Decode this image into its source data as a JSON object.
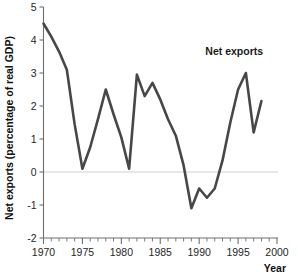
{
  "chart_data": {
    "type": "line",
    "title": "",
    "xlabel": "Year",
    "ylabel": "Net exports (percentage of real GDP)",
    "xlim": [
      1970,
      2000
    ],
    "ylim": [
      -2,
      5
    ],
    "grid": false,
    "zero_line": true,
    "legend_position": "inline-annotation",
    "annotations": [
      {
        "text": "Net exports",
        "x": 1994.5,
        "y": 3.55
      }
    ],
    "xticks": [
      1970,
      1975,
      1980,
      1985,
      1990,
      1995,
      2000
    ],
    "xtick_labels": [
      "1970",
      "1975",
      "1980",
      "1985",
      "1990",
      "1995",
      "2000"
    ],
    "xminor_tick_step": 1,
    "yticks": [
      -2,
      -1,
      0,
      1,
      2,
      3,
      4,
      5
    ],
    "ytick_labels": [
      "-2",
      "-1",
      "0",
      "1",
      "2",
      "3",
      "4",
      "5"
    ],
    "series": [
      {
        "name": "Net exports",
        "color": "#474747",
        "x": [
          1970,
          1971,
          1972,
          1973,
          1974,
          1975,
          1976,
          1977,
          1978,
          1979,
          1980,
          1981,
          1982,
          1983,
          1984,
          1985,
          1986,
          1987,
          1988,
          1989,
          1990,
          1991,
          1992,
          1993,
          1994,
          1995,
          1996,
          1997,
          1998
        ],
        "values": [
          4.5,
          4.1,
          3.65,
          3.1,
          1.45,
          0.1,
          0.75,
          1.6,
          2.5,
          1.75,
          1.05,
          0.1,
          2.95,
          2.3,
          2.7,
          2.2,
          1.6,
          1.1,
          0.2,
          -1.1,
          -0.5,
          -0.78,
          -0.5,
          0.35,
          1.5,
          2.5,
          3.0,
          1.2,
          2.15
        ]
      }
    ]
  },
  "axis": {
    "y_title": "Net exports (percentage of real GDP)",
    "x_title": "Year"
  }
}
